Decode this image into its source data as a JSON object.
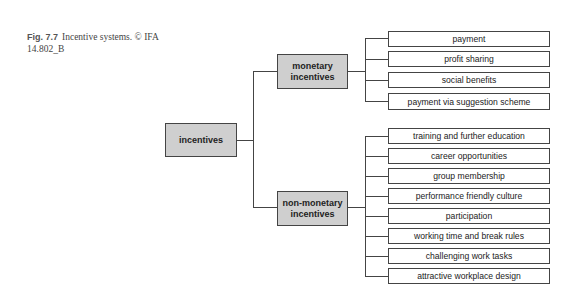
{
  "caption": {
    "figure_label": "Fig. 7.7",
    "text": "Incentive systems. © IFA 14.802_B"
  },
  "diagram": {
    "root": {
      "label": "incentives"
    },
    "branches": [
      {
        "label_line1": "monetary",
        "label_line2": "incentives",
        "children": [
          "payment",
          "profit sharing",
          "social benefits",
          "payment via suggestion scheme"
        ]
      },
      {
        "label_line1": "non-monetary",
        "label_line2": "incentives",
        "children": [
          "training and further education",
          "career opportunities",
          "group membership",
          "performance friendly culture",
          "participation",
          "working time and break rules",
          "challenging work tasks",
          "attractive workplace design"
        ]
      }
    ],
    "colors": {
      "category_fill": "#cfcfcf",
      "leaf_fill": "#ffffff",
      "stroke": "#444444"
    }
  }
}
